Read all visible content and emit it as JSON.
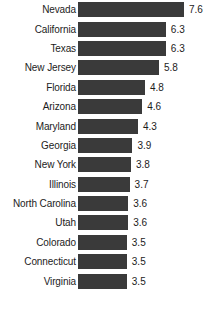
{
  "chart_data": {
    "type": "bar",
    "orientation": "horizontal",
    "title": "",
    "subtitle": "",
    "xlabel": "",
    "ylabel": "",
    "xlim": [
      0,
      7.6
    ],
    "grid": false,
    "legend": null,
    "bar_color": "#3a3a3a",
    "text_color": "#1c1c1c",
    "background": "#ffffff",
    "categories": [
      "Nevada",
      "California",
      "Texas",
      "New Jersey",
      "Florida",
      "Arizona",
      "Maryland",
      "Georgia",
      "New York",
      "Illinois",
      "North Carolina",
      "Utah",
      "Colorado",
      "Connecticut",
      "Virginia"
    ],
    "values": [
      7.6,
      6.3,
      6.3,
      5.8,
      4.8,
      4.6,
      4.3,
      3.9,
      3.8,
      3.7,
      3.6,
      3.6,
      3.5,
      3.5,
      3.5
    ],
    "value_labels": [
      "7.6",
      "6.3",
      "6.3",
      "5.8",
      "4.8",
      "4.6",
      "4.3",
      "3.9",
      "3.8",
      "3.7",
      "3.6",
      "3.6",
      "3.5",
      "3.5",
      "3.5"
    ],
    "rows": [
      {
        "category": "Nevada",
        "value": 7.6,
        "label": "7.6"
      },
      {
        "category": "California",
        "value": 6.3,
        "label": "6.3"
      },
      {
        "category": "Texas",
        "value": 6.3,
        "label": "6.3"
      },
      {
        "category": "New Jersey",
        "value": 5.8,
        "label": "5.8"
      },
      {
        "category": "Florida",
        "value": 4.8,
        "label": "4.8"
      },
      {
        "category": "Arizona",
        "value": 4.6,
        "label": "4.6"
      },
      {
        "category": "Maryland",
        "value": 4.3,
        "label": "4.3"
      },
      {
        "category": "Georgia",
        "value": 3.9,
        "label": "3.9"
      },
      {
        "category": "New York",
        "value": 3.8,
        "label": "3.8"
      },
      {
        "category": "Illinois",
        "value": 3.7,
        "label": "3.7"
      },
      {
        "category": "North Carolina",
        "value": 3.6,
        "label": "3.6"
      },
      {
        "category": "Utah",
        "value": 3.6,
        "label": "3.6"
      },
      {
        "category": "Colorado",
        "value": 3.5,
        "label": "3.5"
      },
      {
        "category": "Connecticut",
        "value": 3.5,
        "label": "3.5"
      },
      {
        "category": "Virginia",
        "value": 3.5,
        "label": "3.5"
      }
    ]
  }
}
